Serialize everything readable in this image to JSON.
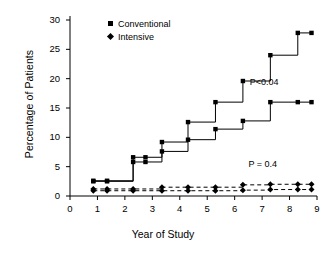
{
  "chart_data": {
    "type": "line",
    "title": "",
    "xlabel": "Year of Study",
    "ylabel": "Percentage of Patients",
    "xlim": [
      0,
      9
    ],
    "ylim": [
      0,
      30
    ],
    "xticks": [
      "0",
      "1",
      "2",
      "3",
      "4",
      "5",
      "6",
      "7",
      "8",
      "9"
    ],
    "yticks": [
      "0",
      "5",
      "10",
      "15",
      "20",
      "25",
      "30"
    ],
    "grid": false,
    "legend_position": "top-left",
    "legend": [
      {
        "label": "Conventional",
        "marker": "square"
      },
      {
        "label": "Intensive",
        "marker": "diamond"
      }
    ],
    "annotations": [
      {
        "text": "P<0.04",
        "x": 6.55,
        "y": 19.2
      },
      {
        "text": "P = 0.4",
        "x": 6.5,
        "y": 5.2
      }
    ],
    "series": [
      {
        "name": "Conventional (upper solid)",
        "style": "solid",
        "marker": "square",
        "x": [
          0.85,
          1.35,
          2.3,
          2.75,
          3.35,
          4.3,
          5.3,
          6.3,
          7.3,
          8.3,
          8.8
        ],
        "y": [
          2.6,
          2.6,
          6.6,
          6.6,
          9.2,
          12.6,
          16.0,
          19.6,
          24.0,
          27.8,
          27.8
        ]
      },
      {
        "name": "Conventional (lower solid)",
        "style": "solid",
        "marker": "square",
        "x": [
          0.85,
          1.35,
          2.3,
          2.75,
          3.35,
          4.3,
          5.3,
          6.3,
          7.3,
          8.3,
          8.8
        ],
        "y": [
          2.5,
          2.5,
          5.8,
          5.8,
          7.6,
          9.6,
          11.4,
          12.8,
          16.0,
          16.0,
          16.0
        ]
      },
      {
        "name": "Intensive (upper dashed)",
        "style": "dashed",
        "marker": "diamond",
        "x": [
          0.85,
          1.35,
          2.3,
          3.35,
          4.3,
          5.3,
          6.3,
          7.3,
          8.3,
          8.8
        ],
        "y": [
          1.2,
          1.2,
          1.2,
          1.5,
          1.5,
          1.5,
          1.9,
          2.0,
          2.0,
          2.0
        ]
      },
      {
        "name": "Intensive (lower dashed)",
        "style": "dashed",
        "marker": "diamond",
        "x": [
          0.85,
          1.35,
          2.3,
          3.35,
          4.3,
          5.3,
          6.3,
          7.3,
          8.3,
          8.8
        ],
        "y": [
          0.9,
          0.9,
          0.9,
          0.9,
          0.9,
          0.9,
          1.0,
          1.1,
          1.1,
          1.1
        ]
      }
    ]
  },
  "axis": {
    "ylabel": "Percentage of Patients",
    "xlabel": "Year of Study"
  },
  "legend": {
    "conventional": "Conventional",
    "intensive": "Intensive"
  },
  "annotations": {
    "p_upper": "P<0.04",
    "p_lower": "P = 0.4"
  },
  "colors": {
    "ink": "#000000",
    "background": "#ffffff"
  }
}
